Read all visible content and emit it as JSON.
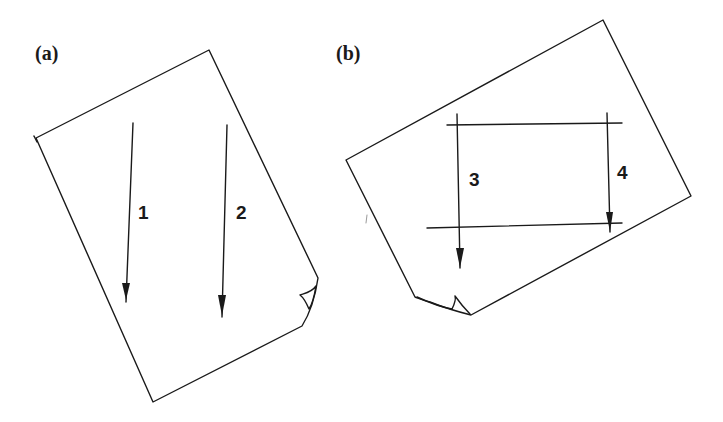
{
  "figure": {
    "panels": [
      {
        "id": "a",
        "label": "(a)",
        "description": "Rotated sheet of paper with two parallel downward arrows",
        "arrows": [
          {
            "label": "1"
          },
          {
            "label": "2"
          }
        ]
      },
      {
        "id": "b",
        "label": "(b)",
        "description": "Rotated sheet of paper with two horizontal lines and two downward arrows between them",
        "arrows": [
          {
            "label": "3"
          },
          {
            "label": "4"
          }
        ]
      }
    ],
    "colors": {
      "ink": "#1a1a1a",
      "background": "#ffffff"
    }
  }
}
